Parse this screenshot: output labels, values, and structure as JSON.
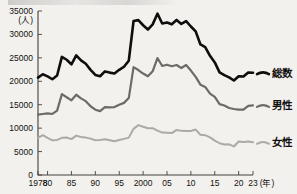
{
  "chart_data": {
    "type": "line",
    "title": "",
    "xlabel": "(年)",
    "ylabel": "(人)",
    "unit_label": "(人)",
    "xlim": [
      1978,
      2023
    ],
    "ylim": [
      0,
      35000
    ],
    "grid": false,
    "legend_position": "right",
    "y_ticks": [
      "0",
      "5000",
      "10000",
      "15000",
      "20000",
      "25000",
      "30000",
      "35000"
    ],
    "y_tick_values": [
      0,
      5000,
      10000,
      15000,
      20000,
      25000,
      30000,
      35000
    ],
    "x_ticks": [
      "1978",
      "80",
      "85",
      "90",
      "95",
      "2000",
      "05",
      "10",
      "15",
      "20",
      "23"
    ],
    "x_tick_values": [
      1978,
      1980,
      1985,
      1990,
      1995,
      2000,
      2005,
      2010,
      2015,
      2020,
      2023
    ],
    "x": [
      1978,
      1979,
      1980,
      1981,
      1982,
      1983,
      1984,
      1985,
      1986,
      1987,
      1988,
      1989,
      1990,
      1991,
      1992,
      1993,
      1994,
      1995,
      1996,
      1997,
      1998,
      1999,
      2000,
      2001,
      2002,
      2003,
      2004,
      2005,
      2006,
      2007,
      2008,
      2009,
      2010,
      2011,
      2012,
      2013,
      2014,
      2015,
      2016,
      2017,
      2018,
      2019,
      2020,
      2021,
      2022,
      2023
    ],
    "series": [
      {
        "name": "総数",
        "color": "#100e0c",
        "values": [
          20788,
          21503,
          21048,
          20434,
          21228,
          25202,
          24596,
          23599,
          25524,
          24460,
          23742,
          22436,
          21346,
          21084,
          22104,
          21851,
          21679,
          22445,
          23104,
          24391,
          32863,
          33048,
          31957,
          31042,
          32143,
          34427,
          32325,
          32552,
          32155,
          33093,
          32249,
          32845,
          31690,
          30651,
          27858,
          27283,
          25427,
          24025,
          21897,
          21321,
          20840,
          20169,
          21081,
          21007,
          21881,
          21837
        ]
      },
      {
        "name": "男性",
        "color": "#6e6b67",
        "values": [
          12880,
          13015,
          13133,
          13024,
          13742,
          17267,
          16601,
          15937,
          17126,
          16352,
          15763,
          14673,
          13939,
          13634,
          14476,
          14440,
          14494,
          14985,
          15393,
          16415,
          23013,
          22402,
          21656,
          21070,
          22140,
          24963,
          23272,
          23540,
          23213,
          23478,
          22831,
          23472,
          22283,
          20955,
          19273,
          18787,
          17386,
          16681,
          15121,
          14826,
          14290,
          14078,
          13943,
          13939,
          14746,
          14862
        ]
      },
      {
        "name": "女性",
        "color": "#adaaa6",
        "values": [
          7908,
          8488,
          7915,
          7410,
          7486,
          7935,
          7995,
          7662,
          8398,
          8108,
          7979,
          7763,
          7407,
          7450,
          7628,
          7411,
          7185,
          7460,
          7711,
          7976,
          9850,
          10646,
          10301,
          9972,
          10003,
          9464,
          9053,
          9012,
          8942,
          9615,
          9418,
          9373,
          9407,
          9696,
          8585,
          8496,
          8041,
          7344,
          6776,
          6495,
          6550,
          6091,
          7138,
          7068,
          7135,
          6975
        ]
      }
    ]
  },
  "legend": {
    "items": [
      {
        "label": "総数",
        "color": "#100e0c"
      },
      {
        "label": "男性",
        "color": "#6e6b67"
      },
      {
        "label": "女性",
        "color": "#adaaa6"
      }
    ]
  }
}
